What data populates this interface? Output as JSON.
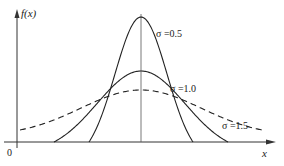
{
  "chart_data": {
    "type": "line",
    "title": "",
    "xlabel": "x",
    "ylabel": "f(x)",
    "origin_label": "0",
    "grid": false,
    "legend_position": "inline labels",
    "series": [
      {
        "name": "σ=0.5",
        "label": "σ =0.5",
        "sigma": 0.5,
        "style": "solid",
        "peak": 0.798
      },
      {
        "name": "σ=1.0",
        "label": "σ =1.0",
        "sigma": 1.0,
        "style": "solid",
        "peak": 0.399
      },
      {
        "name": "σ=1.5",
        "label": "σ =1.5",
        "sigma": 1.5,
        "style": "dashed",
        "peak": 0.266
      }
    ],
    "mean": 0,
    "annotations": [
      "vertical line at mean"
    ]
  },
  "labels": {
    "y_axis": "f(x)",
    "x_axis": "x",
    "origin": "0",
    "s05": "σ =0.5",
    "s10": "σ =1.0",
    "s15": "σ =1.5"
  }
}
